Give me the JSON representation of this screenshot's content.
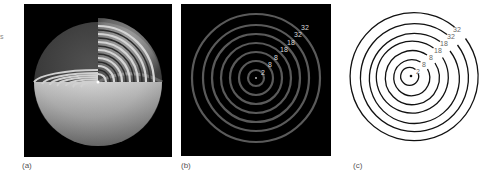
{
  "figure": {
    "edge_mark": "s",
    "panels": [
      {
        "id": "a",
        "caption": "(a)",
        "description": "3D cutaway of nested spherical shells, glowing on black background",
        "background": "#000000",
        "shell_count": 7
      },
      {
        "id": "b",
        "caption": "(b)",
        "description": "Cross-section: concentric faint gray rings on black background",
        "background": "#000000",
        "ring_color": "#5a5a5a",
        "label_color": "#d8d8d8",
        "labels": [
          "2",
          "8",
          "8",
          "18",
          "18",
          "32",
          "32"
        ]
      },
      {
        "id": "c",
        "caption": "(c)",
        "description": "Line drawing: concentric black circles on white background",
        "background": "#ffffff",
        "ring_color": "#111111",
        "label_color": "#666666",
        "labels": [
          "2",
          "8",
          "8",
          "18",
          "18",
          "32",
          "32"
        ]
      }
    ]
  }
}
